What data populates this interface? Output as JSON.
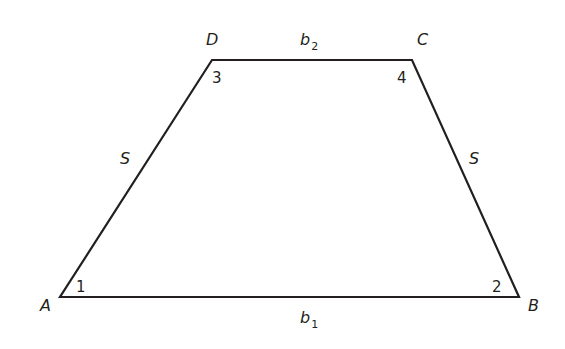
{
  "figure": {
    "type": "isosceles-trapezoid",
    "stroke_color": "#231f20",
    "background": "#ffffff",
    "vertices": {
      "A": {
        "label": "A",
        "x": 60,
        "y": 297
      },
      "B": {
        "label": "B",
        "x": 519,
        "y": 297
      },
      "C": {
        "label": "C",
        "x": 412,
        "y": 60
      },
      "D": {
        "label": "D",
        "x": 212,
        "y": 60
      }
    },
    "angles": {
      "a1": "1",
      "a2": "2",
      "a3": "3",
      "a4": "4"
    },
    "sides": {
      "top": {
        "base": "b",
        "sub": "2"
      },
      "bottom": {
        "base": "b",
        "sub": "1"
      },
      "left": "S",
      "right": "S"
    }
  }
}
